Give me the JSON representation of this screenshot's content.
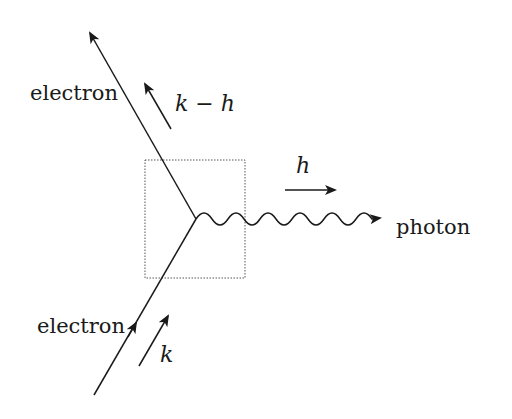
{
  "diagram": {
    "type": "feynman-vertex",
    "labels": {
      "electron_out": "electron",
      "electron_in": "electron",
      "photon": "photon",
      "momentum_out": "k − h",
      "momentum_in": "k",
      "momentum_photon": "h"
    },
    "colors": {
      "line": "#1a1a1a",
      "box": "#555555",
      "background": "#ffffff"
    }
  }
}
